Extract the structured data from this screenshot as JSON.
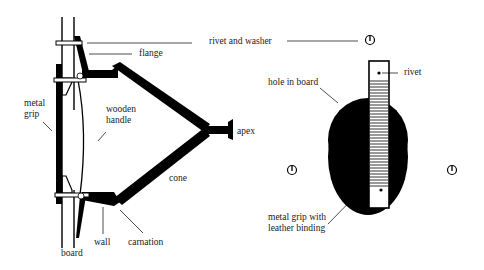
{
  "diagram": {
    "title": "",
    "colors": {
      "ink": "#000000",
      "text": "#1a1a1a",
      "background": "#ffffff"
    },
    "side_view": {
      "labels": {
        "rivet_and_washer": "rivet and washer",
        "flange": "flange",
        "metal_grip": "metal\ngrip",
        "wooden_handle": "wooden\nhandle",
        "apex": "apex",
        "cone": "cone",
        "wall": "wall",
        "carnation": "carnation",
        "board": "board"
      }
    },
    "front_view": {
      "labels": {
        "hole_in_board": "hole in board",
        "rivet": "rivet",
        "metal_grip_with_leather_binding": "metal grip with\nleather binding"
      },
      "washer_icons": [
        "washer-top",
        "washer-left",
        "washer-right"
      ]
    }
  }
}
